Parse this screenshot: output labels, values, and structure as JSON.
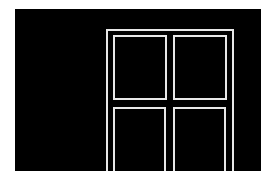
{
  "scene": {
    "description": "Black background with white-outlined door frame containing four panels",
    "background_color": "#000000",
    "line_color": "#e8e8e8",
    "page_color": "#ffffff",
    "panels": [
      "top-left",
      "top-right",
      "bottom-left",
      "bottom-right"
    ]
  }
}
